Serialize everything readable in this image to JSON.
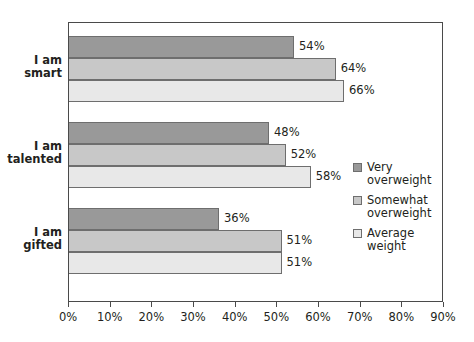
{
  "chart_data": {
    "type": "bar",
    "orientation": "horizontal",
    "title": "",
    "xlabel": "",
    "ylabel": "",
    "xlim": [
      0,
      90
    ],
    "xtick_labels": [
      "0%",
      "10%",
      "20%",
      "30%",
      "40%",
      "50%",
      "60%",
      "70%",
      "80%",
      "90%"
    ],
    "xtick_values": [
      0,
      10,
      20,
      30,
      40,
      50,
      60,
      70,
      80,
      90
    ],
    "grid": false,
    "legend_position": "right",
    "categories": [
      "I am\nsmart",
      "I am\ntalented",
      "I am\ngifted"
    ],
    "series": [
      {
        "name": "Very\noverweight",
        "color": "#999999",
        "values": [
          54,
          48,
          36
        ],
        "labels": [
          "54%",
          "48%",
          "36%"
        ]
      },
      {
        "name": "Somewhat\noverweight",
        "color": "#c8c8c8",
        "values": [
          64,
          52,
          51
        ],
        "labels": [
          "64%",
          "52%",
          "51%"
        ]
      },
      {
        "name": "Average\nweight",
        "color": "#e8e8e8",
        "values": [
          66,
          58,
          51
        ],
        "labels": [
          "66%",
          "51%",
          "51%"
        ]
      }
    ]
  },
  "axis": {
    "ticks": [
      {
        "label": "0%",
        "value": 0
      },
      {
        "label": "10%",
        "value": 10
      },
      {
        "label": "20%",
        "value": 20
      },
      {
        "label": "30%",
        "value": 30
      },
      {
        "label": "40%",
        "value": 40
      },
      {
        "label": "50%",
        "value": 50
      },
      {
        "label": "60%",
        "value": 60
      },
      {
        "label": "70%",
        "value": 70
      },
      {
        "label": "80%",
        "value": 80
      },
      {
        "label": "90%",
        "value": 90
      }
    ]
  },
  "categories": [
    {
      "line1": "I am",
      "line2": "smart"
    },
    {
      "line1": "I am",
      "line2": "talented"
    },
    {
      "line1": "I am",
      "line2": "gifted"
    }
  ],
  "legend": {
    "items": [
      {
        "label": "Very\noverweight",
        "color": "#999999"
      },
      {
        "label": "Somewhat\noverweight",
        "color": "#c8c8c8"
      },
      {
        "label": "Average\nweight",
        "color": "#e8e8e8"
      }
    ]
  },
  "bars": {
    "group0": [
      {
        "series": 0,
        "value": 54,
        "label": "54%"
      },
      {
        "series": 1,
        "value": 64,
        "label": "64%"
      },
      {
        "series": 2,
        "value": 66,
        "label": "66%"
      }
    ],
    "group1": [
      {
        "series": 0,
        "value": 48,
        "label": "48%"
      },
      {
        "series": 1,
        "value": 52,
        "label": "52%"
      },
      {
        "series": 2,
        "value": 58,
        "label": "58%"
      }
    ],
    "group2": [
      {
        "series": 0,
        "value": 36,
        "label": "36%"
      },
      {
        "series": 1,
        "value": 51,
        "label": "51%"
      },
      {
        "series": 2,
        "value": 51,
        "label": "51%"
      }
    ]
  }
}
